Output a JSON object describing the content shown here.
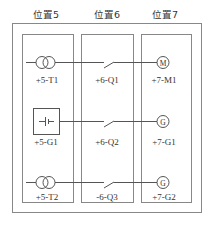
{
  "diagram": {
    "type": "electrical-location-diagram",
    "colors": {
      "line": "#555555",
      "frame": "#888888",
      "text": "#333333"
    },
    "positions": [
      {
        "label": "位置5"
      },
      {
        "label": "位置6"
      },
      {
        "label": "位置7"
      }
    ],
    "rows": [
      {
        "source": {
          "type": "transformer",
          "label": "+5-T1"
        },
        "switch": {
          "type": "switch",
          "label": "+6-Q1"
        },
        "load": {
          "type": "motor",
          "symbol": "M",
          "label": "+7-M1"
        }
      },
      {
        "source": {
          "type": "battery",
          "label": "+5-G1"
        },
        "switch": {
          "type": "switch",
          "label": "+6-Q2"
        },
        "load": {
          "type": "generator",
          "symbol": "G",
          "label": "+7-G1"
        }
      },
      {
        "source": {
          "type": "transformer",
          "label": "+5-T2"
        },
        "switch": {
          "type": "switch",
          "label": "-6-Q3"
        },
        "load": {
          "type": "generator",
          "symbol": "G",
          "label": "+7-G2"
        }
      }
    ]
  }
}
